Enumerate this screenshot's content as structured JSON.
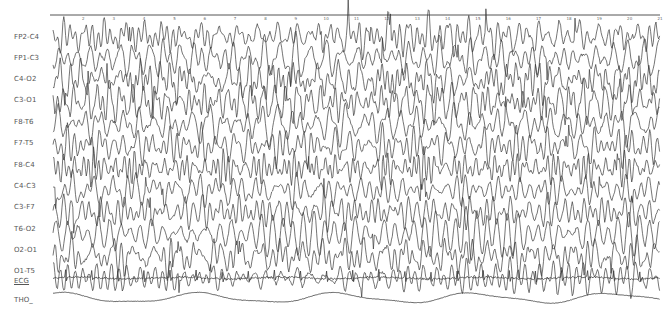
{
  "chart_data": {
    "type": "line",
    "title": "",
    "xlabel": "Time (s)",
    "ylabel": "",
    "grid": false,
    "legend": "none",
    "time_axis": {
      "ticks": [
        2,
        3,
        4,
        5,
        6,
        7,
        8,
        9,
        10,
        11,
        12,
        13,
        14,
        15,
        16,
        17,
        18,
        19,
        20,
        21
      ],
      "x_start_px": 53,
      "x_end_px": 660,
      "axis_y_px": 15,
      "range_s": [
        1,
        21
      ]
    },
    "channels": [
      {
        "label": "FP2-C4",
        "baseline_y": 36,
        "amplitude": 14,
        "freq": 1.9,
        "seed": 11,
        "type": "eeg"
      },
      {
        "label": "FP1-C3",
        "baseline_y": 58,
        "amplitude": 14,
        "freq": 1.8,
        "seed": 23,
        "type": "eeg"
      },
      {
        "label": "C4-O2",
        "baseline_y": 80,
        "amplitude": 15,
        "freq": 2.1,
        "seed": 37,
        "type": "eeg"
      },
      {
        "label": "C3-O1",
        "baseline_y": 102,
        "amplitude": 15,
        "freq": 2.0,
        "seed": 41,
        "type": "eeg"
      },
      {
        "label": "F8-T6",
        "baseline_y": 124,
        "amplitude": 14,
        "freq": 1.7,
        "seed": 53,
        "type": "eeg"
      },
      {
        "label": "F7-T5",
        "baseline_y": 146,
        "amplitude": 14,
        "freq": 1.9,
        "seed": 67,
        "type": "eeg"
      },
      {
        "label": "F8-C4",
        "baseline_y": 168,
        "amplitude": 13,
        "freq": 2.2,
        "seed": 71,
        "type": "eeg"
      },
      {
        "label": "C4-C3",
        "baseline_y": 190,
        "amplitude": 12,
        "freq": 2.3,
        "seed": 83,
        "type": "eeg"
      },
      {
        "label": "C3-F7",
        "baseline_y": 212,
        "amplitude": 13,
        "freq": 2.0,
        "seed": 97,
        "type": "eeg"
      },
      {
        "label": "T6-O2",
        "baseline_y": 234,
        "amplitude": 14,
        "freq": 1.8,
        "seed": 101,
        "type": "eeg"
      },
      {
        "label": "O2-O1",
        "baseline_y": 256,
        "amplitude": 14,
        "freq": 2.1,
        "seed": 113,
        "type": "eeg"
      },
      {
        "label": "O1-T5",
        "baseline_y": 278,
        "amplitude": 13,
        "freq": 1.9,
        "seed": 127,
        "type": "eeg"
      },
      {
        "label": "ECG",
        "baseline_y": 278,
        "amplitude": 3,
        "freq": 1.2,
        "seed": 131,
        "type": "ecg",
        "underlined": true
      },
      {
        "label": "THO_",
        "baseline_y": 298,
        "amplitude": 5,
        "freq": 0.22,
        "seed": 139,
        "type": "resp"
      }
    ],
    "label_positions_y": [
      37,
      58,
      79,
      100,
      122,
      143,
      165,
      186,
      207,
      229,
      250,
      271,
      281,
      300
    ],
    "colors": {
      "trace": "#3a3a3a",
      "axis": "#555555",
      "label": "#555555",
      "background": "#ffffff"
    }
  }
}
